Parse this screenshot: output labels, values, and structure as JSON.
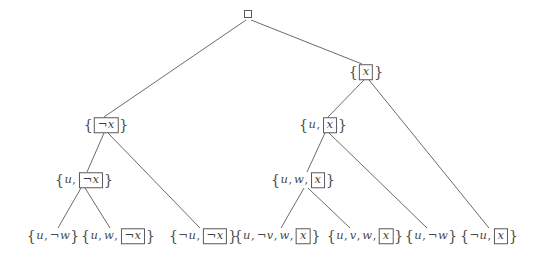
{
  "figure": {
    "type": "resolution-refutation-tree",
    "background_color": "#ffffff",
    "stroke_color": "#5a5a5a",
    "text_color": "#4a4a4a",
    "width": 537,
    "height": 257
  },
  "nodes": [
    {
      "id": "root",
      "label": "□",
      "kind": "empty-clause",
      "x": 248,
      "y": 14,
      "level": 0
    },
    {
      "id": "n-notx",
      "label": "{¬x}",
      "kind": "clause",
      "literals": [
        "¬x"
      ],
      "selected": "¬x",
      "x": 106,
      "y": 125,
      "level": 1
    },
    {
      "id": "n-x",
      "label": "{x}",
      "kind": "clause",
      "literals": [
        "x"
      ],
      "selected": "x",
      "x": 366,
      "y": 72,
      "level": 1
    },
    {
      "id": "n-u-notx",
      "label": "{u, ¬x}",
      "kind": "clause",
      "literals": [
        "u",
        "¬x"
      ],
      "selected": "¬x",
      "x": 84,
      "y": 180,
      "level": 2
    },
    {
      "id": "n-u-x",
      "label": "{u, x}",
      "kind": "clause",
      "literals": [
        "u",
        "x"
      ],
      "selected": "x",
      "x": 323,
      "y": 125,
      "level": 2
    },
    {
      "id": "n-u-w-x",
      "label": "{u, w, x}",
      "kind": "clause",
      "literals": [
        "u",
        "w",
        "x"
      ],
      "selected": "x",
      "x": 303,
      "y": 180,
      "level": 3
    },
    {
      "id": "leaf-1",
      "label": "{u, ¬w}",
      "kind": "input-clause",
      "literals": [
        "u",
        "¬w"
      ],
      "selected": null,
      "x": 53,
      "y": 236,
      "level": 4
    },
    {
      "id": "leaf-2",
      "label": "{u, w, ¬x}",
      "kind": "input-clause",
      "literals": [
        "u",
        "w",
        "¬x"
      ],
      "selected": "¬x",
      "x": 118,
      "y": 236,
      "level": 4
    },
    {
      "id": "leaf-3",
      "label": "{¬u, ¬x}",
      "kind": "input-clause",
      "literals": [
        "¬u",
        "¬x"
      ],
      "selected": "¬x",
      "x": 203,
      "y": 236,
      "level": 4
    },
    {
      "id": "leaf-4",
      "label": "{u, ¬v, w, x}",
      "kind": "input-clause",
      "literals": [
        "u",
        "¬v",
        "w",
        "x"
      ],
      "selected": "x",
      "x": 277,
      "y": 236,
      "level": 4
    },
    {
      "id": "leaf-5",
      "label": "{u, v, w, x}",
      "kind": "input-clause",
      "literals": [
        "u",
        "v",
        "w",
        "x"
      ],
      "selected": "x",
      "x": 365,
      "y": 236,
      "level": 4
    },
    {
      "id": "leaf-6",
      "label": "{u, ¬w}",
      "kind": "input-clause",
      "literals": [
        "u",
        "¬w"
      ],
      "selected": null,
      "x": 431,
      "y": 236,
      "level": 4
    },
    {
      "id": "leaf-7",
      "label": "{¬u, x}",
      "kind": "input-clause",
      "literals": [
        "¬u",
        "x"
      ],
      "selected": "x",
      "x": 489,
      "y": 236,
      "level": 4
    }
  ],
  "edges": [
    {
      "from": "root",
      "to": "n-notx",
      "x1": 246,
      "y1": 20,
      "x2": 104,
      "y2": 117
    },
    {
      "from": "root",
      "to": "n-x",
      "x1": 251,
      "y1": 20,
      "x2": 362,
      "y2": 64
    },
    {
      "from": "n-notx",
      "to": "n-u-notx",
      "x1": 104,
      "y1": 133,
      "x2": 87,
      "y2": 172
    },
    {
      "from": "n-notx",
      "to": "leaf-3",
      "x1": 108,
      "y1": 133,
      "x2": 200,
      "y2": 228
    },
    {
      "from": "n-u-notx",
      "to": "leaf-1",
      "x1": 81,
      "y1": 188,
      "x2": 58,
      "y2": 228
    },
    {
      "from": "n-u-notx",
      "to": "leaf-2",
      "x1": 85,
      "y1": 188,
      "x2": 110,
      "y2": 228
    },
    {
      "from": "n-x",
      "to": "n-u-x",
      "x1": 364,
      "y1": 80,
      "x2": 328,
      "y2": 117
    },
    {
      "from": "n-x",
      "to": "leaf-7",
      "x1": 369,
      "y1": 80,
      "x2": 489,
      "y2": 228
    },
    {
      "from": "n-u-x",
      "to": "n-u-w-x",
      "x1": 325,
      "y1": 133,
      "x2": 307,
      "y2": 172
    },
    {
      "from": "n-u-x",
      "to": "leaf-6",
      "x1": 329,
      "y1": 133,
      "x2": 427,
      "y2": 228
    },
    {
      "from": "n-u-w-x",
      "to": "leaf-4",
      "x1": 304,
      "y1": 188,
      "x2": 281,
      "y2": 228
    },
    {
      "from": "n-u-w-x",
      "to": "leaf-5",
      "x1": 308,
      "y1": 188,
      "x2": 350,
      "y2": 228
    }
  ]
}
